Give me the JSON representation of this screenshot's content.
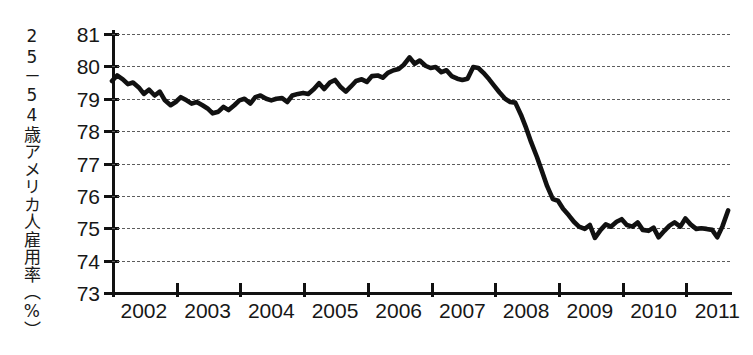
{
  "chart_data": {
    "type": "line",
    "title": "",
    "subtitle": "",
    "xlabel": "",
    "ylabel": "25－54歳アメリカ人雇用率（%）",
    "ylabel_plain": "25-54 Year Old American Employment Rate (%)",
    "ylim": [
      73,
      81
    ],
    "yticks": [
      73,
      74,
      75,
      76,
      77,
      78,
      79,
      80,
      81
    ],
    "ytick_labels": [
      "73",
      "74",
      "75",
      "76",
      "77",
      "78",
      "79",
      "80",
      "81"
    ],
    "xlim": [
      2002.0,
      2011.7
    ],
    "xticks": [
      2002,
      2003,
      2004,
      2005,
      2006,
      2007,
      2008,
      2009,
      2010,
      2011,
      2012
    ],
    "xtick_labels": [
      "2002",
      "2003",
      "2004",
      "2005",
      "2006",
      "2007",
      "2008",
      "2009",
      "2010",
      "2011"
    ],
    "xtick_label_positions": [
      2002.5,
      2003.5,
      2004.5,
      2005.5,
      2006.5,
      2007.5,
      2008.5,
      2009.5,
      2010.5,
      2011.5
    ],
    "grid": true,
    "grid_style": "dashed-horizontal",
    "grid_color": "#5c5c5c",
    "legend": "none",
    "line_color": "#111111",
    "line_width": 4.6,
    "series": [
      {
        "name": "25-54歳アメリカ人雇用率",
        "unit": "%",
        "x": [
          2002.0,
          2002.08,
          2002.17,
          2002.25,
          2002.33,
          2002.42,
          2002.5,
          2002.58,
          2002.67,
          2002.75,
          2002.83,
          2002.92,
          2003.0,
          2003.08,
          2003.17,
          2003.25,
          2003.33,
          2003.42,
          2003.5,
          2003.58,
          2003.67,
          2003.75,
          2003.83,
          2003.92,
          2004.0,
          2004.08,
          2004.17,
          2004.25,
          2004.33,
          2004.42,
          2004.5,
          2004.58,
          2004.67,
          2004.75,
          2004.83,
          2004.92,
          2005.0,
          2005.08,
          2005.17,
          2005.25,
          2005.33,
          2005.42,
          2005.5,
          2005.58,
          2005.67,
          2005.75,
          2005.83,
          2005.92,
          2006.0,
          2006.08,
          2006.17,
          2006.25,
          2006.33,
          2006.42,
          2006.5,
          2006.58,
          2006.67,
          2006.75,
          2006.83,
          2006.92,
          2007.0,
          2007.08,
          2007.17,
          2007.25,
          2007.33,
          2007.42,
          2007.5,
          2007.58,
          2007.67,
          2007.75,
          2007.83,
          2007.92,
          2008.0,
          2008.08,
          2008.17,
          2008.25,
          2008.33,
          2008.42,
          2008.5,
          2008.58,
          2008.67,
          2008.75,
          2008.83,
          2008.92,
          2009.0,
          2009.08,
          2009.17,
          2009.25,
          2009.33,
          2009.42,
          2009.5,
          2009.58,
          2009.67,
          2009.75,
          2009.83,
          2009.92,
          2010.0,
          2010.08,
          2010.17,
          2010.25,
          2010.33,
          2010.42,
          2010.5,
          2010.58,
          2010.67,
          2010.75,
          2010.83,
          2010.92,
          2011.0,
          2011.08,
          2011.17,
          2011.25,
          2011.33,
          2011.42,
          2011.5,
          2011.58,
          2011.67
        ],
        "values": [
          79.55,
          79.72,
          79.6,
          79.45,
          79.5,
          79.35,
          79.15,
          79.28,
          79.1,
          79.22,
          78.95,
          78.8,
          78.9,
          79.05,
          78.95,
          78.85,
          78.9,
          78.8,
          78.7,
          78.55,
          78.6,
          78.75,
          78.65,
          78.8,
          78.95,
          79.0,
          78.85,
          79.05,
          79.1,
          79.0,
          78.95,
          79.0,
          79.02,
          78.9,
          79.1,
          79.15,
          79.18,
          79.15,
          79.3,
          79.48,
          79.3,
          79.5,
          79.58,
          79.38,
          79.22,
          79.38,
          79.55,
          79.6,
          79.52,
          79.7,
          79.72,
          79.65,
          79.8,
          79.88,
          79.92,
          80.05,
          80.28,
          80.08,
          80.18,
          80.02,
          79.95,
          79.98,
          79.82,
          79.88,
          79.7,
          79.62,
          79.58,
          79.62,
          79.98,
          79.95,
          79.8,
          79.6,
          79.4,
          79.2,
          79.0,
          78.9,
          78.88,
          78.5,
          78.1,
          77.65,
          77.2,
          76.75,
          76.3,
          75.9,
          75.85,
          75.6,
          75.4,
          75.2,
          75.05,
          74.98,
          75.1,
          74.7,
          74.95,
          75.12,
          75.05,
          75.2,
          75.28,
          75.1,
          75.05,
          75.18,
          74.95,
          74.92,
          75.02,
          74.72,
          74.92,
          75.08,
          75.18,
          75.05,
          75.3,
          75.12,
          74.98,
          75.0,
          74.98,
          74.95,
          74.72,
          75.05,
          75.55
        ]
      }
    ],
    "annotations": [
      {
        "label": "peak",
        "x": 2006.67,
        "y": 80.28
      },
      {
        "label": "trough",
        "x": 2009.58,
        "y": 74.7
      },
      {
        "label": "series_start",
        "x": 2002.0,
        "y": 79.55
      },
      {
        "label": "series_end",
        "x": 2011.67,
        "y": 75.55
      }
    ]
  }
}
